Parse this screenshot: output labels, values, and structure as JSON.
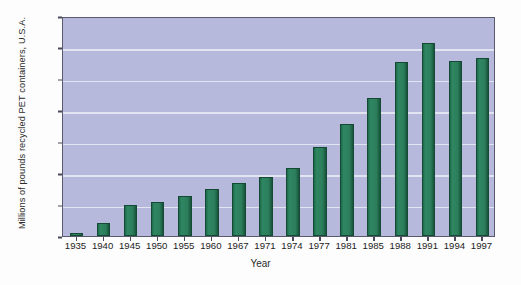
{
  "chart_data": {
    "type": "bar",
    "title": "",
    "subtitle": "",
    "xlabel": "Year",
    "ylabel": "Millions of pounds recycled PET containers, U.S.A.",
    "categories": [
      "1935",
      "1940",
      "1945",
      "1950",
      "1955",
      "1960",
      "1967",
      "1971",
      "1974",
      "1977",
      "1981",
      "1985",
      "1988",
      "1991",
      "1994",
      "1997"
    ],
    "values": [
      10,
      42,
      100,
      107,
      128,
      150,
      168,
      188,
      215,
      282,
      357,
      440,
      553,
      615,
      558,
      565
    ],
    "ylim": [
      0,
      700
    ],
    "ytick_values": [
      0,
      100,
      200,
      300,
      400,
      500,
      600,
      700
    ],
    "ytick_labels": [
      "0",
      "100",
      "200",
      "300",
      "400",
      "500",
      "600",
      "700"
    ],
    "grid": true,
    "legend": false,
    "legend_position": "none",
    "series_name": "Recycled PET containers",
    "colors": {
      "bar_fill": "#2c7e5b",
      "bar_edge": "#144934",
      "plot_background": "#b6b8dc",
      "gridline": "#e3e4f2",
      "axis_frame": "#5a5a6e",
      "figure_background": "#fdfdfd",
      "text": "#1c1c1c"
    }
  }
}
